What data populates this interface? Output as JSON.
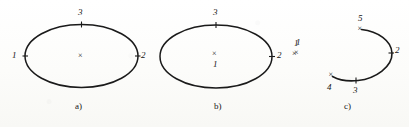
{
  "figure": {
    "caption_a": "a)",
    "caption_b": "b)",
    "caption_c": "c)",
    "stroke_color": "#1a1a1a",
    "label_color": "#141414",
    "background_color": "#fdfdfb",
    "cross_glyph": "×"
  },
  "panel_a": {
    "caption": "a)",
    "shape": "ellipse",
    "labels": {
      "left": "1",
      "right": "2",
      "top": "3"
    },
    "center_marker": "×",
    "center_label": ""
  },
  "panel_b": {
    "caption": "b)",
    "shape": "ellipse",
    "labels": {
      "right": "2",
      "top": "3",
      "center": "1",
      "outside_right": "1"
    },
    "center_marker": "×",
    "outside_marker": "×"
  },
  "panel_c": {
    "caption": "c)",
    "shape": "open-arc",
    "labels": {
      "top_end": "5",
      "right": "2",
      "bottom": "3",
      "bottom_end": "4",
      "outside_left": "1"
    },
    "outside_marker": "×",
    "end_markers": [
      "×",
      "×"
    ],
    "tick_markers": [
      "×",
      "×"
    ]
  }
}
